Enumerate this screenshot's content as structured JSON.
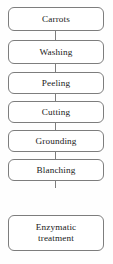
{
  "diagram": {
    "orientation": "vertical",
    "box_border_color": "#7d7d7d",
    "box_fill_color": "#ffffff",
    "background_color": "#fefefe",
    "text_color": "#1a1a1a",
    "steps": [
      {
        "label": "Carrots"
      },
      {
        "label": "Washing"
      },
      {
        "label": "Peeling"
      },
      {
        "label": "Cutting"
      },
      {
        "label": "Grounding"
      },
      {
        "label": "Blanching"
      },
      {
        "label": "Enzymatic\ntreatment"
      }
    ]
  }
}
